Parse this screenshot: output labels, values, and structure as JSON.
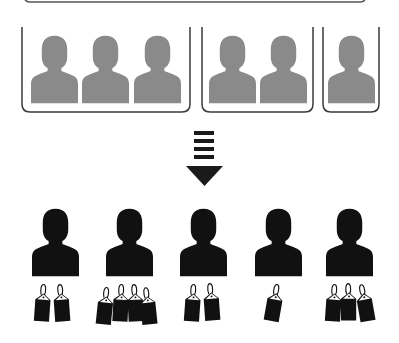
{
  "diagram": {
    "colors": {
      "background": "#ffffff",
      "group_person": "#8a8a8a",
      "group_frame": "#3a3a3a",
      "individual_person": "#111111",
      "arrow": "#1a1a1a",
      "tag": "#111111",
      "tag_flap": "#ffffff"
    },
    "top_bar": {
      "visible": true
    },
    "groups": [
      {
        "id": "group-1",
        "members": 3
      },
      {
        "id": "group-2",
        "members": 2
      },
      {
        "id": "group-3",
        "members": 1
      }
    ],
    "arrow": {
      "direction": "down",
      "dash_count": 4
    },
    "individuals": [
      {
        "id": "person-1",
        "tags": 2
      },
      {
        "id": "person-2",
        "tags": 4
      },
      {
        "id": "person-3",
        "tags": 2
      },
      {
        "id": "person-4",
        "tags": 1
      },
      {
        "id": "person-5",
        "tags": 3
      }
    ]
  }
}
